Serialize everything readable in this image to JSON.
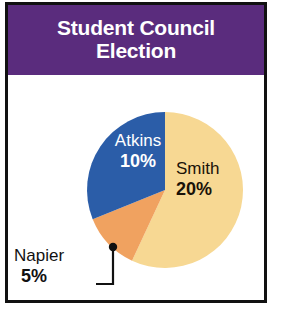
{
  "card": {
    "title": "Student Council\nElection",
    "frame_color": "#111111",
    "banner_color": "#5a2c7d",
    "background_color": "#ffffff"
  },
  "chart_data": {
    "type": "pie",
    "title": "Student Council Election",
    "categories": [
      "Smith",
      "Atkins",
      "Napier"
    ],
    "values": [
      20,
      10,
      5
    ],
    "value_labels": [
      "20%",
      "10%",
      "5%"
    ],
    "unit": "%",
    "colors": [
      "#f7d893",
      "#2b5da8",
      "#f0a260"
    ],
    "legend": "none",
    "label_placement": [
      "inside",
      "inside",
      "outside-leader"
    ],
    "slices": [
      {
        "name": "Smith",
        "value": 20,
        "label": "Smith",
        "value_label": "20%",
        "color": "#f7d893",
        "start_angle_deg": 0,
        "end_angle_deg": 205,
        "text_color": "#1a1208"
      },
      {
        "name": "Atkins",
        "value": 10,
        "label": "Atkins",
        "value_label": "10%",
        "color": "#2b5da8",
        "start_angle_deg": 248,
        "end_angle_deg": 360,
        "text_color": "#ffffff"
      },
      {
        "name": "Napier",
        "value": 5,
        "label": "Napier",
        "value_label": "5%",
        "color": "#f0a260",
        "start_angle_deg": 205,
        "end_angle_deg": 248,
        "text_color": "#111111"
      }
    ]
  },
  "labels": {
    "atkins": {
      "name": "Atkins",
      "pct": "10%"
    },
    "smith": {
      "name": "Smith",
      "pct": "20%"
    },
    "napier": {
      "name": "Napier",
      "pct": "5%"
    }
  },
  "leader": {
    "dot_color": "#111111",
    "line_color": "#111111"
  }
}
